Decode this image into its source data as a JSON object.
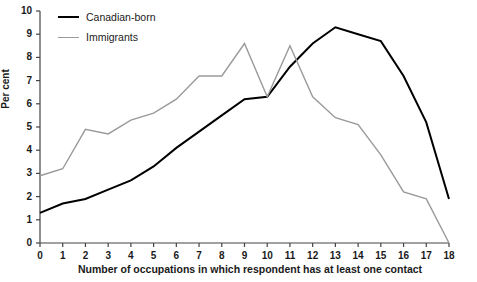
{
  "chart_data": {
    "type": "line",
    "title": "",
    "subtitle": "",
    "xlabel": "Number of occupations in which respondent has at least one contact",
    "ylabel": "Per cent",
    "x": [
      0,
      1,
      2,
      3,
      4,
      5,
      6,
      7,
      8,
      9,
      10,
      11,
      12,
      13,
      14,
      15,
      16,
      17,
      18
    ],
    "xticklabels": [
      "0",
      "1",
      "2",
      "3",
      "4",
      "5",
      "6",
      "7",
      "8",
      "9",
      "10",
      "11",
      "12",
      "13",
      "14",
      "15",
      "16",
      "17",
      "18"
    ],
    "yticklabels": [
      "0",
      "1",
      "2",
      "3",
      "4",
      "5",
      "6",
      "7",
      "8",
      "9",
      "10"
    ],
    "xlim": [
      0,
      18
    ],
    "ylim": [
      0,
      10
    ],
    "ytick_step": 1,
    "grid": false,
    "legend_position": "top-left",
    "series": [
      {
        "name": "Canadian-born",
        "color": "#000000",
        "linewidth": 2.0,
        "values": [
          1.3,
          1.7,
          1.9,
          2.3,
          2.7,
          3.3,
          4.1,
          4.8,
          5.5,
          6.2,
          6.3,
          7.6,
          8.6,
          9.3,
          9.0,
          8.7,
          7.2,
          5.2,
          1.9
        ]
      },
      {
        "name": "Immigrants",
        "color": "#9a9a9a",
        "linewidth": 1.4,
        "values": [
          2.9,
          3.2,
          4.9,
          4.7,
          5.3,
          5.6,
          6.2,
          7.2,
          7.2,
          8.6,
          6.3,
          8.5,
          6.3,
          5.4,
          5.1,
          3.8,
          2.2,
          1.9,
          0.0
        ]
      }
    ],
    "legend": [
      {
        "label": "Canadian-born",
        "color": "#000000",
        "linewidth": 2.0
      },
      {
        "label": "Immigrants",
        "color": "#9a9a9a",
        "linewidth": 1.4
      }
    ],
    "axis_color": "#444444",
    "background": "#ffffff"
  }
}
